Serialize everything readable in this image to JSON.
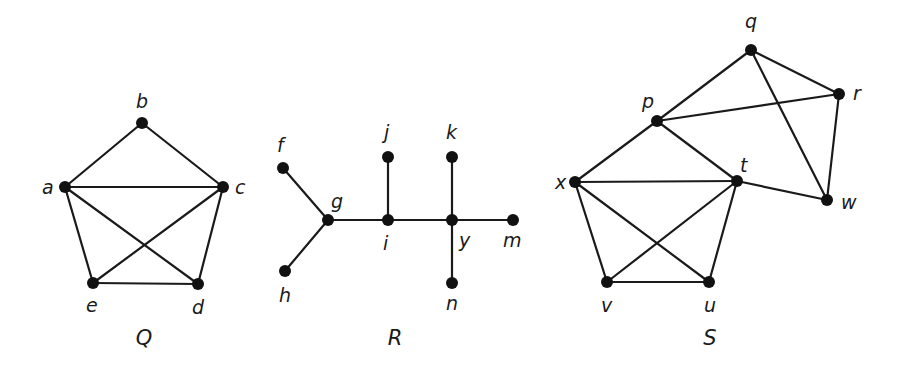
{
  "figure": {
    "graphs": [
      {
        "name": "Q",
        "name_pos": [
          144,
          345
        ],
        "nodes": [
          {
            "id": "a",
            "x": 65,
            "y": 187,
            "lx": 42,
            "ly": 194
          },
          {
            "id": "b",
            "x": 142,
            "y": 123,
            "lx": 136,
            "ly": 108
          },
          {
            "id": "c",
            "x": 223,
            "y": 187,
            "lx": 235,
            "ly": 194
          },
          {
            "id": "d",
            "x": 198,
            "y": 284,
            "lx": 192,
            "ly": 314
          },
          {
            "id": "e",
            "x": 93,
            "y": 283,
            "lx": 86,
            "ly": 312
          }
        ],
        "edges": [
          [
            "a",
            "b"
          ],
          [
            "b",
            "c"
          ],
          [
            "a",
            "c"
          ],
          [
            "a",
            "e"
          ],
          [
            "a",
            "d"
          ],
          [
            "c",
            "e"
          ],
          [
            "c",
            "d"
          ],
          [
            "e",
            "d"
          ]
        ]
      },
      {
        "name": "R",
        "name_pos": [
          395,
          345
        ],
        "nodes": [
          {
            "id": "f",
            "x": 283,
            "y": 168,
            "lx": 277,
            "ly": 152
          },
          {
            "id": "g",
            "x": 328,
            "y": 220,
            "lx": 331,
            "ly": 208
          },
          {
            "id": "h",
            "x": 285,
            "y": 271,
            "lx": 279,
            "ly": 302
          },
          {
            "id": "i",
            "x": 388,
            "y": 220,
            "lx": 383,
            "ly": 250
          },
          {
            "id": "j",
            "x": 388,
            "y": 157,
            "lx": 384,
            "ly": 139
          },
          {
            "id": "k",
            "x": 452,
            "y": 157,
            "lx": 446,
            "ly": 139
          },
          {
            "id": "y",
            "x": 452,
            "y": 220,
            "lx": 459,
            "ly": 247
          },
          {
            "id": "m",
            "x": 513,
            "y": 220,
            "lx": 503,
            "ly": 247
          },
          {
            "id": "n",
            "x": 452,
            "y": 283,
            "lx": 446,
            "ly": 310
          }
        ],
        "edges": [
          [
            "f",
            "g"
          ],
          [
            "h",
            "g"
          ],
          [
            "g",
            "i"
          ],
          [
            "i",
            "j"
          ],
          [
            "i",
            "y"
          ],
          [
            "k",
            "y"
          ],
          [
            "y",
            "m"
          ],
          [
            "y",
            "n"
          ]
        ]
      },
      {
        "name": "S",
        "name_pos": [
          710,
          345
        ],
        "nodes": [
          {
            "id": "p",
            "x": 657,
            "y": 121,
            "lx": 642,
            "ly": 108
          },
          {
            "id": "q",
            "x": 751,
            "y": 50,
            "lx": 745,
            "ly": 28
          },
          {
            "id": "r",
            "x": 839,
            "y": 94,
            "lx": 853,
            "ly": 100
          },
          {
            "id": "t",
            "x": 737,
            "y": 181,
            "lx": 740,
            "ly": 172
          },
          {
            "id": "w",
            "x": 827,
            "y": 200,
            "lx": 841,
            "ly": 209
          },
          {
            "id": "x",
            "x": 575,
            "y": 182,
            "lx": 555,
            "ly": 189
          },
          {
            "id": "v",
            "x": 607,
            "y": 282,
            "lx": 601,
            "ly": 312
          },
          {
            "id": "u",
            "x": 709,
            "y": 282,
            "lx": 704,
            "ly": 312
          }
        ],
        "edges": [
          [
            "p",
            "q"
          ],
          [
            "q",
            "r"
          ],
          [
            "p",
            "r"
          ],
          [
            "q",
            "w"
          ],
          [
            "r",
            "w"
          ],
          [
            "p",
            "x"
          ],
          [
            "p",
            "t"
          ],
          [
            "x",
            "t"
          ],
          [
            "t",
            "w"
          ],
          [
            "x",
            "v"
          ],
          [
            "x",
            "u"
          ],
          [
            "t",
            "v"
          ],
          [
            "t",
            "u"
          ],
          [
            "v",
            "u"
          ]
        ]
      }
    ]
  }
}
